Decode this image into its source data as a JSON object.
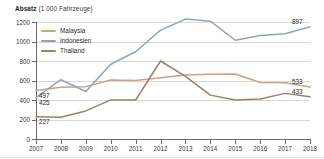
{
  "chart_data": {
    "type": "line",
    "title": "Absatz (1 000 Fahrzeuge)",
    "title_bold_part": "Absatz",
    "title_unit_part": " (1 000 Fahrzeuge)",
    "xlabel": "",
    "ylabel": "Absatz (1 000 Fahrzeuge)",
    "x": [
      2007,
      2008,
      2009,
      2010,
      2011,
      2012,
      2013,
      2014,
      2015,
      2016,
      2017,
      2018
    ],
    "categories": [
      "2007",
      "2008",
      "2009",
      "2010",
      "2011",
      "2012",
      "2013",
      "2014",
      "2015",
      "2016",
      "2017",
      "2018"
    ],
    "ylim": [
      0,
      1200
    ],
    "yticks": [
      0,
      200,
      400,
      600,
      800,
      1000,
      1200
    ],
    "ytick_labels": [
      "0",
      "200",
      "400",
      "600",
      "800",
      "1000",
      "1200"
    ],
    "grid": true,
    "legend_position": "top-left",
    "series": [
      {
        "name": "Malaysia",
        "color": "#d4a07a",
        "values": [
          497,
          530,
          537,
          605,
          600,
          628,
          656,
          664,
          667,
          580,
          577,
          533
        ],
        "start_label": "497",
        "end_label": "533"
      },
      {
        "name": "Indonesien",
        "color": "#8fa4c4",
        "values": [
          425,
          608,
          487,
          767,
          895,
          1116,
          1230,
          1208,
          1013,
          1062,
          1079,
          1151
        ],
        "start_label": "425",
        "end_label": "897"
      },
      {
        "name": "Thailand",
        "color": "#9c8268",
        "values": [
          227,
          222,
          288,
          401,
          400,
          800,
          643,
          450,
          400,
          410,
          468,
          433
        ],
        "start_label": "227",
        "end_label": "433"
      }
    ],
    "value_labels": [
      {
        "text": "497",
        "series": "Malaysia",
        "side": "left"
      },
      {
        "text": "425",
        "series": "Indonesien",
        "side": "left"
      },
      {
        "text": "227",
        "series": "Thailand",
        "side": "left"
      },
      {
        "text": "897",
        "series": "Indonesien",
        "side": "right"
      },
      {
        "text": "533",
        "series": "Malaysia",
        "side": "right"
      },
      {
        "text": "433",
        "series": "Thailand",
        "side": "right"
      }
    ]
  },
  "legend": {
    "items": [
      {
        "label": "Malaysia",
        "color": "#d4a07a"
      },
      {
        "label": "Indonesien",
        "color": "#8fa4c4"
      },
      {
        "label": "Thailand",
        "color": "#9c8268"
      }
    ]
  }
}
